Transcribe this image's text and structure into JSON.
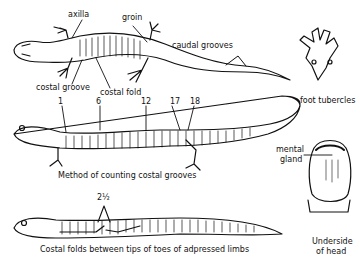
{
  "figure": {
    "panel_1": {
      "labels": {
        "axilla": "axilla",
        "groin": "groin",
        "caudal_grooves": "caudal grooves",
        "costal_groove": "costal groove",
        "costal_fold": "costal fold"
      }
    },
    "foot": {
      "caption": "foot tubercles"
    },
    "panel_2": {
      "groove_numbers": [
        "1",
        "6",
        "12",
        "17",
        "18"
      ],
      "caption": "Method of counting costal grooves"
    },
    "head": {
      "label": "mental gland",
      "label_line1": "mental",
      "label_line2": "gland",
      "caption_line1": "Underside",
      "caption_line2": "of head"
    },
    "panel_3": {
      "count": "2½",
      "caption": "Costal folds between tips of toes of adpressed limbs"
    }
  }
}
